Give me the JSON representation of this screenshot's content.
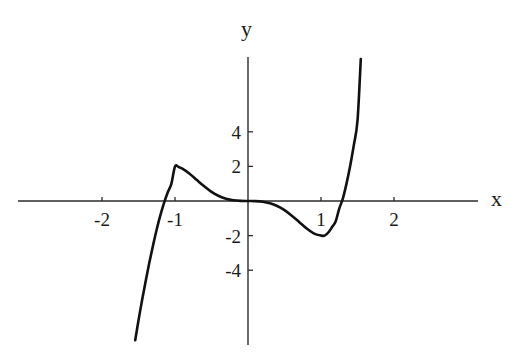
{
  "chart_data": {
    "type": "line",
    "title": "",
    "subtitle": "",
    "xlabel": "x",
    "ylabel": "y",
    "xlim": [
      -2.62,
      3.15
    ],
    "ylim": [
      -8.3,
      8.3
    ],
    "grid": false,
    "legend": null,
    "annotations": [],
    "x_ticks": [
      {
        "value": -2,
        "label": "-2"
      },
      {
        "value": -1,
        "label": "-1"
      },
      {
        "value": 1,
        "label": "1"
      },
      {
        "value": 2,
        "label": "2"
      }
    ],
    "y_ticks": [
      {
        "value": 4,
        "label": "4"
      },
      {
        "value": 2,
        "label": "2"
      },
      {
        "value": -2,
        "label": "-2"
      },
      {
        "value": -4,
        "label": "-4"
      }
    ],
    "series": [
      {
        "name": "curve",
        "color": "#111111",
        "formula_description": "quintic polynomial 3x^5 - 5x^3",
        "x_domain": [
          -1.545,
          1.545
        ],
        "points": [
          {
            "x": -1.545,
            "y": -8.05
          },
          {
            "x": -1.5,
            "y": -6.9
          },
          {
            "x": -1.45,
            "y": -5.71
          },
          {
            "x": -1.4,
            "y": -4.59
          },
          {
            "x": -1.35,
            "y": -3.53
          },
          {
            "x": -1.3,
            "y": -2.55
          },
          {
            "x": -1.25,
            "y": -1.63
          },
          {
            "x": -1.2,
            "y": -0.82
          },
          {
            "x": -1.15,
            "y": -0.11
          },
          {
            "x": -1.1,
            "y": 0.49
          },
          {
            "x": -1.05,
            "y": 0.99
          },
          {
            "x": -1.0,
            "y": 2.0
          },
          {
            "x": -0.95,
            "y": 1.96
          },
          {
            "x": -0.9,
            "y": 1.87
          },
          {
            "x": -0.8,
            "y": 1.58
          },
          {
            "x": -0.7,
            "y": 1.21
          },
          {
            "x": -0.6,
            "y": 0.85
          },
          {
            "x": -0.5,
            "y": 0.53
          },
          {
            "x": -0.4,
            "y": 0.29
          },
          {
            "x": -0.3,
            "y": 0.13
          },
          {
            "x": -0.2,
            "y": 0.04
          },
          {
            "x": -0.1,
            "y": 0.005
          },
          {
            "x": 0.0,
            "y": 0.0
          },
          {
            "x": 0.1,
            "y": -0.005
          },
          {
            "x": 0.2,
            "y": -0.04
          },
          {
            "x": 0.3,
            "y": -0.13
          },
          {
            "x": 0.4,
            "y": -0.29
          },
          {
            "x": 0.5,
            "y": -0.53
          },
          {
            "x": 0.6,
            "y": -0.85
          },
          {
            "x": 0.7,
            "y": -1.21
          },
          {
            "x": 0.8,
            "y": -1.58
          },
          {
            "x": 0.9,
            "y": -1.87
          },
          {
            "x": 1.0,
            "y": -2.0
          },
          {
            "x": 1.05,
            "y": -2.0
          },
          {
            "x": 1.1,
            "y": -1.82
          },
          {
            "x": 1.15,
            "y": -1.52
          },
          {
            "x": 1.2,
            "y": -1.18
          },
          {
            "x": 1.25,
            "y": -0.44
          },
          {
            "x": 1.3,
            "y": 0.15
          },
          {
            "x": 1.35,
            "y": 1.02
          },
          {
            "x": 1.4,
            "y": 2.04
          },
          {
            "x": 1.45,
            "y": 3.24
          },
          {
            "x": 1.5,
            "y": 4.64
          },
          {
            "x": 1.545,
            "y": 8.2
          }
        ]
      }
    ]
  }
}
